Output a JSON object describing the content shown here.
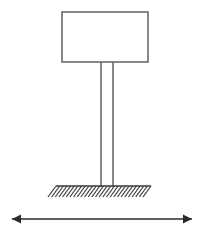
{
  "figure": {
    "title": "",
    "kind": "structural-schematic",
    "canvas": {
      "width": 203,
      "height": 237,
      "background": "#ffffff"
    }
  },
  "style": {
    "line_color": "#6a6a6a",
    "line_color_dark": "#3a3a3a",
    "arrow_color": "#2b2b2b",
    "panel_fill": "#ffffff",
    "line_width": 1.6,
    "hatch_line_width": 1.2,
    "arrow_line_width": 1.6
  },
  "elements": {
    "sign_panel": {
      "label": "sign-panel",
      "x": 62,
      "y": 12,
      "width": 86,
      "height": 50,
      "fill": "#ffffff",
      "stroke": "#6a6a6a"
    },
    "post": {
      "label": "support-post",
      "left_x": 101,
      "right_x": 113,
      "top_y": 62,
      "bottom_y": 187,
      "stroke": "#6a6a6a"
    },
    "ground": {
      "label": "fixed-base-ground",
      "line_x1": 56,
      "line_x2": 151,
      "line_y": 186,
      "hatch_count": 27,
      "hatch_length": 11,
      "hatch_dx": 8,
      "hatch_dy": 11,
      "stroke": "#3a3a3a"
    },
    "dimension_arrow": {
      "label": "horizontal-direction-arrow",
      "x1": 12,
      "x2": 192,
      "y": 219,
      "head_length": 9,
      "head_half_width": 4.5,
      "stroke": "#2b2b2b",
      "annotation": ""
    }
  }
}
